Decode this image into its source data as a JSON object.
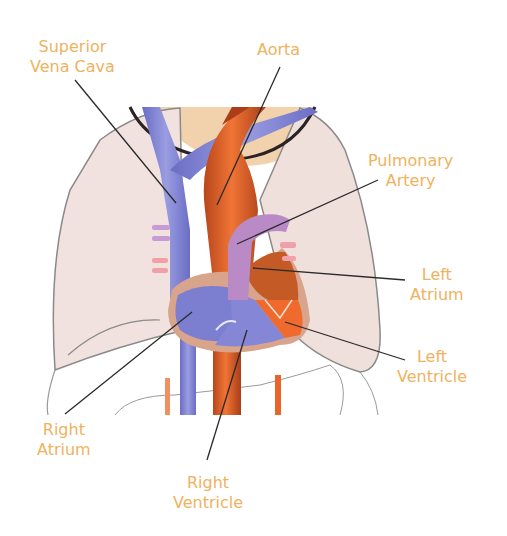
{
  "diagram": {
    "label_color": "#efb25e",
    "colors": {
      "lung": "#f1e2e0",
      "deoxygenated": "#7c7fd0",
      "oxygenated": "#e8642a",
      "pulmonary_artery": "#b98ac6",
      "pericardium": "#d8a58c",
      "throat": "#f2d2ad"
    },
    "labels": [
      {
        "id": "superior-vena-cava",
        "line1": "Superior",
        "line2": "Vena Cava"
      },
      {
        "id": "aorta",
        "line1": "Aorta",
        "line2": ""
      },
      {
        "id": "pulmonary-artery",
        "line1": "Pulmonary",
        "line2": "Artery"
      },
      {
        "id": "left-atrium",
        "line1": "Left",
        "line2": "Atrium"
      },
      {
        "id": "left-ventricle",
        "line1": "Left",
        "line2": "Ventricle"
      },
      {
        "id": "right-atrium",
        "line1": "Right",
        "line2": "Atrium"
      },
      {
        "id": "right-ventricle",
        "line1": "Right",
        "line2": "Ventricle"
      }
    ]
  }
}
